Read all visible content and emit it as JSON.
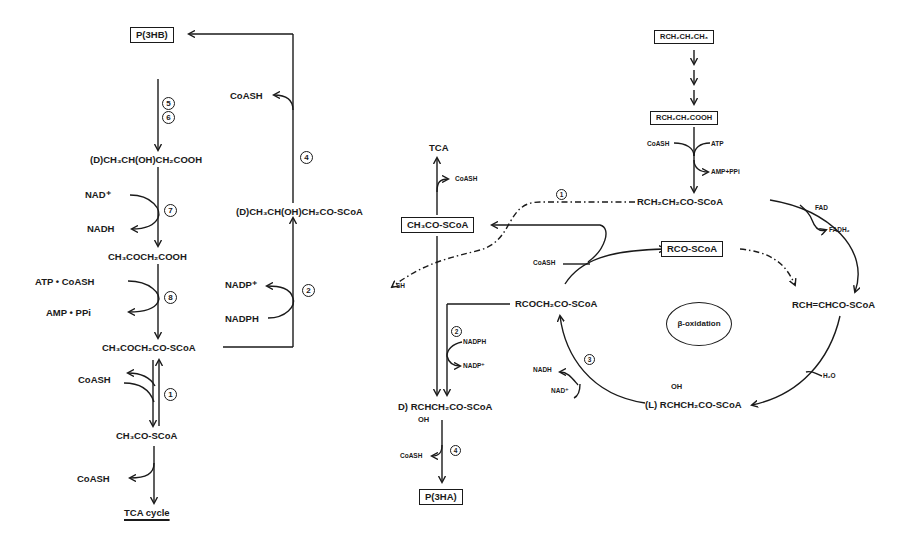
{
  "left_pathway": {
    "nodes": {
      "p3hb": "P(3HB)",
      "d_3hb_acid": "(D)CH₃CH(OH)CH₂COOH",
      "acetoacetate": "CH₃COCH₂COOH",
      "acetoacetyl_coa": "CH₃COCH₂CO-SCoA",
      "acetyl_coa": "CH₃CO-SCoA",
      "tca_cycle": "TCA cycle",
      "d_3hb_coa": "(D)CH₃CH(OH)CH₂CO-SCoA"
    },
    "cofactors": {
      "nad_plus": "NAD⁺",
      "nadh": "NADH",
      "atp_coash": "ATP  •  CoASH",
      "amp_ppi": "AMP  •  PPi",
      "coash_1": "CoASH",
      "coash_2": "CoASH",
      "coash_4": "CoASH",
      "nadp_plus": "NADP⁺",
      "nadph": "NADPH"
    },
    "enzyme_steps": [
      "5",
      "6",
      "7",
      "8",
      "1",
      "2",
      "4"
    ]
  },
  "right_pathway": {
    "nodes": {
      "alkane": "RCH₂CH₂CH₃",
      "fatty_acid": "RCH₂CH₂COOH",
      "acyl_coa": "RCH₂CH₂CO-SCoA",
      "enoyl_coa": "RCH=CHCO-SCoA",
      "l_hydroxyacyl_coa": "(L) RCHCH₂CO-SCoA",
      "l_oh": "OH",
      "ketoacyl_coa": "RCOCH₂CO-SCoA",
      "rco_scoa": "RCO-SCoA",
      "acetyl_coa": "CH₃CO-SCoA",
      "tca": "TCA",
      "d_hydroxyacyl_coa": "D) RCHCH₂CO-SCoA",
      "d_oh": "OH",
      "p3ha": "P(3HA)",
      "sh_partial": "SH",
      "beta_oxidation": "β-oxidation"
    },
    "cofactors": {
      "coash_act": "CoASH",
      "atp": "ATP",
      "amp_ppi": "AMP+PPi",
      "fad": "FAD",
      "fadh2": "FADH₂",
      "h2o": "H₂O",
      "nadh": "NADH",
      "nad_plus": "NAD⁺",
      "coash_thiolase": "CoASH",
      "coash_tca": "CoASH",
      "nadph": "NADPH",
      "nadp_plus": "NADP⁺",
      "coash_pha": "CoASH"
    },
    "enzyme_steps": [
      "1",
      "2",
      "3",
      "4"
    ]
  },
  "colors": {
    "ink": "#1a1a1a",
    "background": "#ffffff"
  }
}
